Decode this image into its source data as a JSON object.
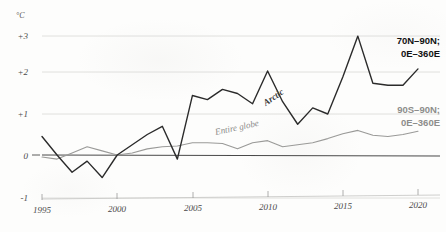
{
  "chart_data": {
    "type": "line",
    "title": "",
    "subtitle": "",
    "xlabel": "",
    "ylabel": "",
    "yunit": "°C",
    "xlim": [
      1995,
      2020
    ],
    "ylim": [
      -1,
      3
    ],
    "grid": true,
    "gridlines_y": [
      3,
      2,
      1,
      0
    ],
    "legend_position": "right-inline",
    "x": [
      1995,
      1996,
      1997,
      1998,
      1999,
      2000,
      2001,
      2002,
      2003,
      2004,
      2005,
      2006,
      2007,
      2008,
      2009,
      2010,
      2011,
      2012,
      2013,
      2014,
      2015,
      2016,
      2017,
      2018,
      2019,
      2020
    ],
    "xtick_labels": [
      "1995",
      "2000",
      "2005",
      "2010",
      "2015",
      "2020"
    ],
    "xtick_values": [
      1995,
      2000,
      2005,
      2010,
      2015,
      2020
    ],
    "ytick_labels": [
      "+3",
      "+2",
      "+1",
      "0",
      "-1"
    ],
    "ytick_values": [
      3,
      2,
      1,
      0,
      -1
    ],
    "series": [
      {
        "name": "Arctic",
        "inline_label": "Arctic",
        "legend_line1": "70N–90N;",
        "legend_line2": "0E–360E",
        "color": "#2b2b2b",
        "width": 1.4,
        "values": [
          0.45,
          0.0,
          -0.42,
          -0.15,
          -0.55,
          0.0,
          0.25,
          0.5,
          0.7,
          -0.1,
          1.45,
          1.35,
          1.6,
          1.5,
          1.25,
          2.05,
          1.3,
          0.75,
          1.15,
          1.0,
          1.9,
          2.9,
          1.75,
          1.7,
          1.7,
          2.1
        ]
      },
      {
        "name": "Entire globe",
        "inline_label": "Entire globe",
        "legend_line1": "90S–90N;",
        "legend_line2": "0E–360E",
        "color": "#9a9a98",
        "width": 1.1,
        "values": [
          -0.05,
          -0.1,
          0.05,
          0.2,
          0.1,
          0.0,
          0.05,
          0.15,
          0.2,
          0.22,
          0.3,
          0.3,
          0.28,
          0.15,
          0.3,
          0.35,
          0.2,
          0.25,
          0.3,
          0.4,
          0.52,
          0.6,
          0.48,
          0.45,
          0.5,
          0.58
        ]
      }
    ],
    "reference_line": {
      "name": "zero-baseline",
      "value": 0,
      "color": "#4a4a4a"
    },
    "annotations": [
      {
        "text": "Arctic",
        "x": 2010.5,
        "y": 1.35,
        "rotation": -34
      },
      {
        "text": "Entire globe",
        "x": 2008.0,
        "y": 0.6,
        "rotation": -12
      }
    ]
  },
  "axes": {
    "unit": "°C",
    "y_labels": [
      "+3",
      "+2",
      "+1",
      "0",
      "-1"
    ],
    "x_labels": [
      "1995",
      "2000",
      "2005",
      "2010",
      "2015",
      "2020"
    ]
  },
  "legend": {
    "arctic": {
      "line1": "70N–90N;",
      "line2": "0E–360E",
      "color": "#111111"
    },
    "globe": {
      "line1": "90S–90N;",
      "line2": "0E–360E",
      "color": "#8d8d8b"
    }
  }
}
